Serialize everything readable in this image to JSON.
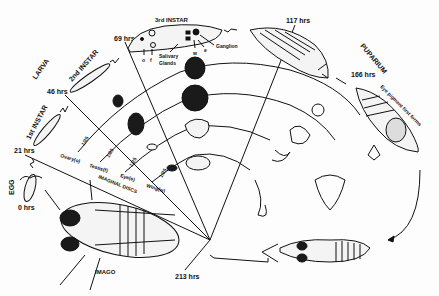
{
  "diagram": {
    "stages": [
      {
        "id": "egg",
        "label": "EGG",
        "time": "0 hrs"
      },
      {
        "id": "larva",
        "label": "LARVA"
      },
      {
        "id": "instar1",
        "label": "1st INSTAR",
        "time": "21 hrs"
      },
      {
        "id": "instar2",
        "label": "2nd INSTAR",
        "time": "46 hrs"
      },
      {
        "id": "instar3",
        "label": "3rd INSTAR",
        "time": "69 hrs"
      },
      {
        "id": "prepupa",
        "time": "117 hrs"
      },
      {
        "id": "puparium",
        "label": "PUPARIUM",
        "time": "166 hrs"
      },
      {
        "id": "imago",
        "label": "IMAGO",
        "time": "213 hrs"
      }
    ],
    "annotations": {
      "salivary_glands": "Salivary Glands",
      "salivary_line1": "Salivary",
      "salivary_line2": "Glands",
      "ganglion": "Ganglion",
      "eye_pigment": "Eye pigment first forms",
      "o": "o",
      "f": "f",
      "w": "w",
      "e": "e"
    },
    "imaginal_discs": {
      "title": "IMAGINAL DISCS",
      "discs": [
        {
          "label": "Ovary(o)",
          "scale": "1/25"
        },
        {
          "label": "Testis(f)",
          "scale": "1/25"
        },
        {
          "label": "Eye(e)",
          "scale": "1/25"
        },
        {
          "label": "Wing(w)",
          "scale": "1/25"
        }
      ]
    }
  }
}
